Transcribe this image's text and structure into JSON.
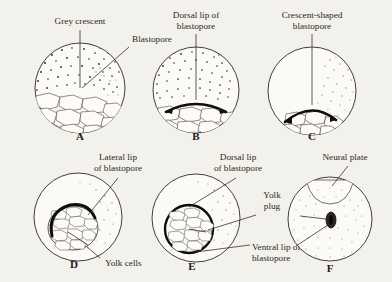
{
  "figure": {
    "background_color": "#f3f1ec",
    "ink_color": "#2b2722"
  },
  "panels": [
    {
      "letter": "A",
      "labels": [
        {
          "name": "grey-crescent",
          "text": "Grey crescent",
          "lines": [
            "Grey crescent"
          ]
        },
        {
          "name": "blastopore",
          "text": "Blastopore",
          "lines": [
            "Blastopore"
          ]
        }
      ]
    },
    {
      "letter": "B",
      "labels": [
        {
          "name": "dorsal-lip-of-blastopore",
          "text": "Dorsal lip of blastopore",
          "lines": [
            "Dorsal lip of",
            "blastopore"
          ]
        }
      ]
    },
    {
      "letter": "C",
      "labels": [
        {
          "name": "crescent-shaped-blastopore",
          "text": "Crescent-shaped blastopore",
          "lines": [
            "Crescent-shaped",
            "blastopore"
          ]
        }
      ]
    },
    {
      "letter": "D",
      "labels": [
        {
          "name": "lateral-lip-of-blastopore",
          "text": "Lateral lip of blastopore",
          "lines": [
            "Lateral lip",
            "of blastopore"
          ]
        },
        {
          "name": "yolk-cells",
          "text": "Yolk cells",
          "lines": [
            "Yolk cells"
          ]
        }
      ]
    },
    {
      "letter": "E",
      "labels": [
        {
          "name": "dorsal-lip-of-blastopore",
          "text": "Dorsal lip of blastopore",
          "lines": [
            "Dorsal lip",
            "of blastopore"
          ]
        },
        {
          "name": "yolk-plug",
          "text": "Yolk plug",
          "lines": [
            "Yolk",
            "plug"
          ]
        },
        {
          "name": "ventral-lip-of-blastopore",
          "text": "Ventral lip of blastopore",
          "lines": [
            "Ventral lip of",
            "blastopore"
          ]
        }
      ]
    },
    {
      "letter": "F",
      "labels": [
        {
          "name": "neural-plate",
          "text": "Neural plate",
          "lines": [
            "Neural plate"
          ]
        }
      ]
    }
  ],
  "text": {
    "grey_crescent": "Grey crescent",
    "blastopore": "Blastopore",
    "dorsal_lip_1": "Dorsal lip of",
    "dorsal_lip_2": "blastopore",
    "crescent_1": "Crescent-shaped",
    "crescent_2": "blastopore",
    "lateral_lip_1": "Lateral lip",
    "lateral_lip_2": "of blastopore",
    "yolk_cells": "Yolk cells",
    "dorsal_lip_e_1": "Dorsal lip",
    "dorsal_lip_e_2": "of blastopore",
    "yolk_plug_1": "Yolk",
    "yolk_plug_2": "plug",
    "ventral_lip_1": "Ventral lip of",
    "ventral_lip_2": "blastopore",
    "neural_plate": "Neural plate",
    "letter_a": "A",
    "letter_b": "B",
    "letter_c": "C",
    "letter_d": "D",
    "letter_e": "E",
    "letter_f": "F"
  }
}
